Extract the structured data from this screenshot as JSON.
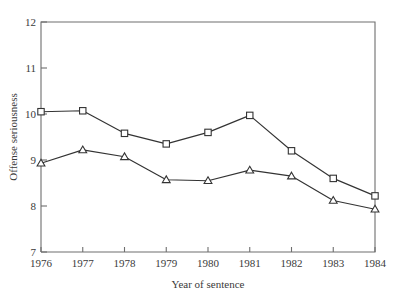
{
  "chart_data": {
    "type": "line",
    "title": "",
    "xlabel": "Year of sentence",
    "ylabel": "Offense seriousness",
    "categories": [
      "1976",
      "1977",
      "1978",
      "1979",
      "1980",
      "1981",
      "1982",
      "1983",
      "1984"
    ],
    "x": [
      1976,
      1977,
      1978,
      1979,
      1980,
      1981,
      1982,
      1983,
      1984
    ],
    "xlim": [
      1976,
      1984
    ],
    "ylim": [
      7,
      12
    ],
    "yticks": [
      7,
      8,
      9,
      10,
      11,
      12
    ],
    "yticklabels": [
      "7",
      "8",
      "9",
      "10",
      "11",
      "12"
    ],
    "xticklabels": [
      "1976",
      "1977",
      "1978",
      "1979",
      "1980",
      "1981",
      "1982",
      "1983",
      "1984"
    ],
    "grid": false,
    "legend": "none",
    "series": [
      {
        "name": "upper-series",
        "marker": "square",
        "color": "#333333",
        "values": [
          10.05,
          10.07,
          9.58,
          9.35,
          9.6,
          9.97,
          9.2,
          8.6,
          8.22
        ]
      },
      {
        "name": "lower-series",
        "marker": "triangle",
        "color": "#333333",
        "values": [
          8.93,
          9.22,
          9.07,
          8.57,
          8.55,
          8.78,
          8.65,
          8.12,
          7.93
        ]
      }
    ]
  },
  "axes": {
    "y_title": "Offense seriousness",
    "x_title": "Year of sentence"
  }
}
